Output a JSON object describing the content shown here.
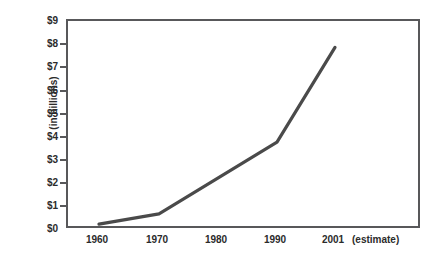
{
  "chart_data": {
    "type": "line",
    "title": "",
    "xlabel": "",
    "ylabel": "(in billions)",
    "x": [
      1960,
      1970,
      1980,
      1990,
      2001
    ],
    "categories": [
      "1960",
      "1970",
      "1980",
      "1990",
      "2001"
    ],
    "values": [
      0.25,
      0.7,
      2.2,
      3.8,
      7.9
    ],
    "series": [
      {
        "name": "",
        "values": [
          0.25,
          0.7,
          2.2,
          3.8,
          7.9
        ]
      }
    ],
    "vertices": [
      {
        "x": 1960,
        "y": 0.25
      },
      {
        "x": 1970,
        "y": 0.7
      },
      {
        "x": 1990,
        "y": 3.8
      },
      {
        "x": 2001,
        "y": 7.9
      }
    ],
    "ylim": [
      0,
      9
    ],
    "yticks": [
      0,
      1,
      2,
      3,
      4,
      5,
      6,
      7,
      8,
      9
    ],
    "ytick_labels": [
      "$0",
      "$1",
      "$2",
      "$3",
      "$4",
      "$5",
      "$6",
      "$7",
      "$8",
      "$9"
    ],
    "xtick_labels": [
      "1960",
      "1970",
      "1980",
      "1990",
      "2001"
    ],
    "annotations": [
      "(estimate)"
    ],
    "grid": false,
    "legend": "none",
    "line_color": "#4a4a4a",
    "axis_color": "#58585a",
    "background_color": "#ffffff"
  },
  "axes": {
    "y_title": "(in billions)",
    "y_labels": [
      "$9",
      "$8",
      "$7",
      "$6",
      "$5",
      "$4",
      "$3",
      "$2",
      "$1",
      "$0"
    ],
    "x_labels": [
      "1960",
      "1970",
      "1980",
      "1990",
      "2001"
    ],
    "x_note": "(estimate)"
  }
}
